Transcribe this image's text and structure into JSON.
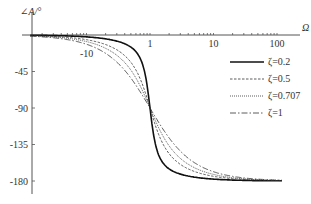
{
  "chart_data": {
    "type": "line",
    "title": "",
    "xlabel": "Ω",
    "ylabel": "∠A/°",
    "x_scale": "log",
    "x_ticks": [
      "1",
      "10",
      "100"
    ],
    "y_ticks": [
      "-45",
      "-90",
      "-135",
      "-180"
    ],
    "ylim": [
      -190,
      5
    ],
    "xlim": [
      0.013,
      120
    ],
    "annotations": [
      {
        "text": "-10",
        "x": 0.25,
        "y": -12
      }
    ],
    "legend": {
      "position": "right",
      "entries": [
        "ζ=0.2",
        "ζ=0.5",
        "ζ=0.707",
        "ζ=1"
      ]
    },
    "series": [
      {
        "name": "ζ=0.2",
        "style": "solid-bold",
        "zeta": 0.2
      },
      {
        "name": "ζ=0.5",
        "style": "dashed",
        "zeta": 0.5
      },
      {
        "name": "ζ=0.707",
        "style": "dotted",
        "zeta": 0.707
      },
      {
        "name": "ζ=1",
        "style": "dash-dot",
        "zeta": 1.0
      }
    ],
    "sample_points": {
      "x": [
        0.1,
        0.5,
        1,
        2,
        10
      ],
      "ζ=0.2": [
        -2.3,
        -14.9,
        -90,
        -165.1,
        -177.7
      ],
      "ζ=0.5": [
        -5.8,
        -33.7,
        -90,
        -146.3,
        -174.2
      ],
      "ζ=0.707": [
        -8.2,
        -43.3,
        -90,
        -136.7,
        -171.8
      ],
      "ζ=1": [
        -11.4,
        -53.1,
        -90,
        -126.9,
        -168.6
      ]
    }
  },
  "axis": {
    "y_label": "∠A/°",
    "x_label": "Ω",
    "note": "-10"
  },
  "legend": [
    {
      "label": "ζ=0.2"
    },
    {
      "label": "ζ=0.5"
    },
    {
      "label": "ζ=0.707"
    },
    {
      "label": "ζ=1"
    }
  ]
}
